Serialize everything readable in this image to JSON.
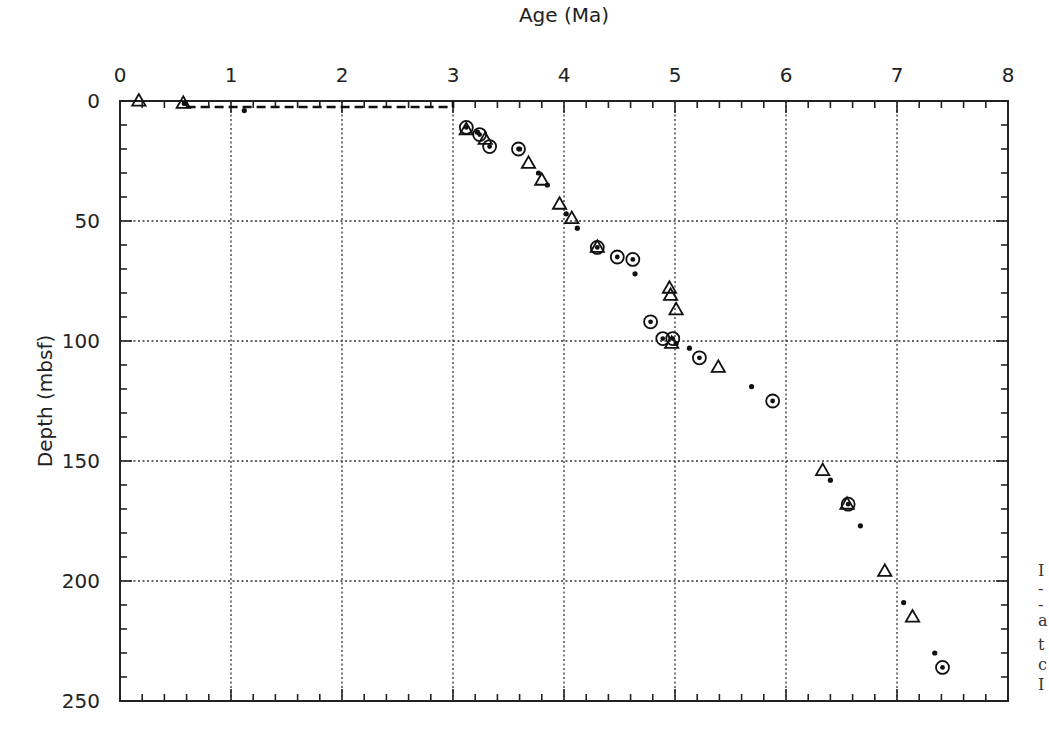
{
  "chart_data": {
    "type": "scatter",
    "title": "",
    "xlabel": "Age (Ma)",
    "ylabel": "Depth (mbsf)",
    "xlim": [
      0,
      8
    ],
    "ylim": [
      0,
      250
    ],
    "y_inverted": true,
    "x_axis_position": "top",
    "x_ticks": [
      0,
      1,
      2,
      3,
      4,
      5,
      6,
      7,
      8
    ],
    "y_ticks": [
      0,
      50,
      100,
      150,
      200,
      250
    ],
    "x_minor_step": 0.2,
    "y_minor_step": 10,
    "grid": "dotted at major ticks",
    "legend": null,
    "series": [
      {
        "name": "triangles",
        "marker": "open-triangle",
        "points": [
          [
            0.17,
            0
          ],
          [
            0.57,
            1
          ],
          [
            3.12,
            12
          ],
          [
            3.29,
            16
          ],
          [
            3.68,
            26
          ],
          [
            3.8,
            33
          ],
          [
            3.96,
            43
          ],
          [
            4.07,
            49
          ],
          [
            4.3,
            61
          ],
          [
            4.95,
            78
          ],
          [
            4.96,
            81
          ],
          [
            5.01,
            87
          ],
          [
            4.97,
            101
          ],
          [
            5.39,
            111
          ],
          [
            6.33,
            154
          ],
          [
            6.55,
            168
          ],
          [
            6.89,
            196
          ],
          [
            7.14,
            215
          ]
        ]
      },
      {
        "name": "circles",
        "marker": "circle-with-dot",
        "points": [
          [
            3.12,
            11
          ],
          [
            3.24,
            14
          ],
          [
            3.33,
            19
          ],
          [
            3.59,
            20
          ],
          [
            4.3,
            61
          ],
          [
            4.48,
            65
          ],
          [
            4.62,
            66
          ],
          [
            4.78,
            92
          ],
          [
            4.89,
            99
          ],
          [
            4.98,
            99
          ],
          [
            5.22,
            107
          ],
          [
            5.88,
            125
          ],
          [
            6.56,
            168
          ],
          [
            7.41,
            236
          ]
        ]
      },
      {
        "name": "dots",
        "marker": "small-filled-dot",
        "points": [
          [
            0.58,
            1
          ],
          [
            1.12,
            4
          ],
          [
            3.22,
            13
          ],
          [
            3.6,
            20
          ],
          [
            3.77,
            30
          ],
          [
            3.85,
            35
          ],
          [
            4.02,
            47
          ],
          [
            4.12,
            53
          ],
          [
            4.64,
            72
          ],
          [
            5.01,
            101
          ],
          [
            5.13,
            103
          ],
          [
            5.69,
            119
          ],
          [
            6.4,
            158
          ],
          [
            6.67,
            177
          ],
          [
            7.06,
            209
          ],
          [
            7.34,
            230
          ]
        ]
      }
    ],
    "annotations": [
      {
        "type": "dashed-line",
        "description": "hiatus line",
        "points": [
          [
            0.6,
            2.5
          ],
          [
            3.0,
            2.5
          ],
          [
            3.0,
            0
          ]
        ]
      }
    ]
  },
  "caption_fragments": [
    "I",
    "-",
    "-",
    "a",
    "t",
    "c",
    "I"
  ]
}
